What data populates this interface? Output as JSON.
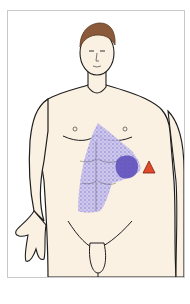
{
  "figure": {
    "title": "Referred pain map - anterior male figure",
    "regions": [
      {
        "name": "diffuse pain area",
        "location": "epigastrium and right upper abdomen",
        "pattern": "purple stippled",
        "color": "#8a7fd6"
      },
      {
        "name": "focal pain area",
        "location": "left upper abdomen below ribs",
        "pattern": "solid purple",
        "color": "#5b4bb8"
      }
    ],
    "marker": {
      "shape": "triangle",
      "color": "#e04a2a",
      "location": "left upper quadrant at costal margin"
    },
    "colors": {
      "skin": "#fbf1e2",
      "hair": "#8a5a3a",
      "outline": "#1e1e1e",
      "frame_border": "#c9c9c9",
      "stipple": "#8a7fd6",
      "focus": "#5b4bb8",
      "marker": "#e04a2a"
    }
  }
}
